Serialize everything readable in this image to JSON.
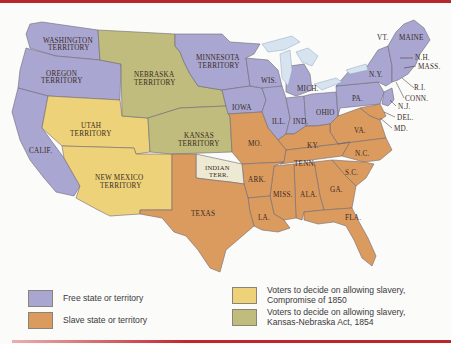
{
  "colors": {
    "free": "#a9a6d1",
    "slave": "#dc9b5e",
    "compromise_1850": "#eed27a",
    "kansas_nebraska": "#bfbc7e",
    "indian_terr": "#ede9d2",
    "water": "#d7e3ef",
    "border": "#6e6a73",
    "accent_bar": "#b8262e"
  },
  "regions": {
    "washington": "WASHINGTON TERRITORY",
    "washington_l1": "WASHINGTON",
    "washington_l2": "TERRITORY",
    "oregon_l1": "OREGON",
    "oregon_l2": "TERRITORY",
    "calif": "CALIF.",
    "utah_l1": "UTAH",
    "utah_l2": "TERRITORY",
    "newmexico_l1": "NEW MEXICO",
    "newmexico_l2": "TERRITORY",
    "nebraska_l1": "NEBRASKA",
    "nebraska_l2": "TERRITORY",
    "kansas_l1": "KANSAS",
    "kansas_l2": "TERRITORY",
    "minnesota_l1": "MINNESOTA",
    "minnesota_l2": "TERRITORY",
    "indian_l1": "INDIAN",
    "indian_l2": "TERR.",
    "texas": "TEXAS",
    "iowa": "IOWA",
    "wis": "WIS.",
    "mich": "MICH.",
    "ill": "ILL.",
    "ind": "IND.",
    "ohio": "OHIO",
    "pa": "PA.",
    "ny": "N.Y.",
    "vt": "VT.",
    "maine": "MAINE",
    "nh": "N.H.",
    "mass": "MASS.",
    "ri": "R.I.",
    "conn": "CONN.",
    "nj": "N.J.",
    "del": "DEL.",
    "md": "MD.",
    "va": "VA.",
    "ky": "KY.",
    "mo": "MO.",
    "tenn": "TENN.",
    "nc": "N.C.",
    "sc": "S.C.",
    "ark": "ARK.",
    "miss": "MISS.",
    "ala": "ALA.",
    "ga": "GA.",
    "la": "LA.",
    "fla": "FLA."
  },
  "legend": [
    {
      "key": "free",
      "label": "Free state or territory"
    },
    {
      "key": "slave",
      "label": "Slave state or territory"
    },
    {
      "key": "compromise_1850",
      "label_l1": "Voters to decide on allowing slavery,",
      "label_l2": "Compromise of 1850"
    },
    {
      "key": "kansas_nebraska",
      "label_l1": "Voters to decide on allowing slavery,",
      "label_l2": "Kansas-Nebraska Act, 1854"
    }
  ]
}
